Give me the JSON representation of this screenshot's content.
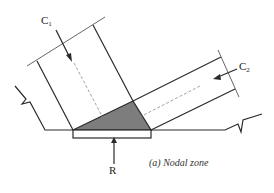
{
  "diagram": {
    "labels": {
      "c1": "C",
      "c1_sub": "1",
      "c2": "C",
      "c2_sub": "2",
      "r": "R"
    },
    "caption": "(a) Nodal zone",
    "colors": {
      "line": "#2a2a2a",
      "node_fill": "#7a7a7a",
      "dashed": "#8a8a8a",
      "background": "#ffffff"
    }
  }
}
